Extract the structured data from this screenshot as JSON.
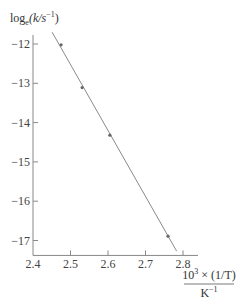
{
  "chart_data": {
    "type": "scatter",
    "title": "",
    "ylabel": "log_e(k/s^-1)",
    "ylabel_parts": {
      "main": "log",
      "sub": "e",
      "paren": "(k/s",
      "sup": "−1",
      "close": ")"
    },
    "xlabel": "10^3 × (1/T) / K^-1",
    "xlabel_parts": {
      "numerator_base": "10",
      "numerator_sup": "3",
      "numerator_rest": " × (1/T)",
      "denominator_base": "K",
      "denominator_sup": "−1"
    },
    "xlim": [
      2.4,
      2.83
    ],
    "ylim": [
      -17.38,
      -11.6
    ],
    "xticks": [
      2.4,
      2.5,
      2.6,
      2.7,
      2.8
    ],
    "xtick_labels": [
      "2.4",
      "2.5",
      "2.6",
      "2.7",
      "2.8"
    ],
    "yticks": [
      -12,
      -13,
      -14,
      -15,
      -16,
      -17
    ],
    "ytick_labels": [
      "−12",
      "−13",
      "−14",
      "−15",
      "−16",
      "−17"
    ],
    "grid": false,
    "legend": null,
    "points": [
      {
        "x": 2.475,
        "y": -12.02
      },
      {
        "x": 2.531,
        "y": -13.11
      },
      {
        "x": 2.605,
        "y": -14.32
      },
      {
        "x": 2.76,
        "y": -16.89
      }
    ],
    "fit_line": {
      "x_start": 2.451,
      "y_start": -11.7,
      "x_end": 2.783,
      "y_end": -17.27
    },
    "colors": {
      "axis": "#888888",
      "line": "#8a8a8a",
      "marker": "#666666",
      "text": "#444444"
    }
  }
}
